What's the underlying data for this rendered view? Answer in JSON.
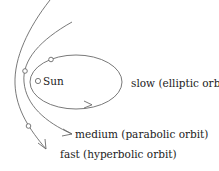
{
  "diagram": {
    "central_body": {
      "label": "Sun"
    },
    "orbits": [
      {
        "id": "elliptic",
        "speed": "slow",
        "label": "slow (elliptic orbit)"
      },
      {
        "id": "parabolic",
        "speed": "medium",
        "label": "medium (parabolic orbit)"
      },
      {
        "id": "hyperbolic",
        "speed": "fast",
        "label": "fast (hyperbolic orbit)"
      }
    ],
    "colors": {
      "line": "#6a6a6a",
      "text": "#222222",
      "background": "#ffffff"
    }
  }
}
